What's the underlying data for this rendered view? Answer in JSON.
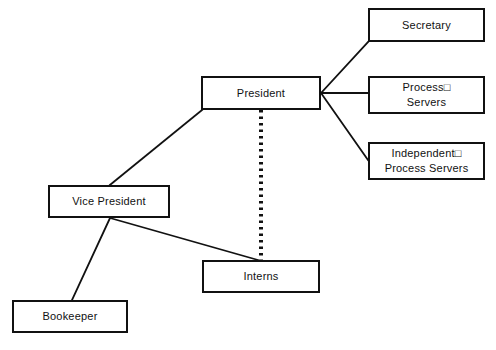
{
  "diagram": {
    "type": "org-chart",
    "canvas": {
      "width": 496,
      "height": 350,
      "background": "#ffffff"
    },
    "line_color": "#111111",
    "box_border_color": "#111111",
    "box_fill_color": "#ffffff",
    "text_color": "#111111",
    "nodes": [
      {
        "id": "president",
        "label": "President",
        "x": 201,
        "y": 76,
        "width": 120,
        "height": 34
      },
      {
        "id": "secretary",
        "label": "Secretary",
        "x": 368,
        "y": 8,
        "width": 117,
        "height": 34
      },
      {
        "id": "process-servers",
        "label": "Process□\nServers",
        "x": 368,
        "y": 76,
        "width": 117,
        "height": 38
      },
      {
        "id": "independent-process-servers",
        "label": "Independent□\nProcess Servers",
        "x": 368,
        "y": 142,
        "width": 117,
        "height": 38
      },
      {
        "id": "vice-president",
        "label": "Vice President",
        "x": 48,
        "y": 185,
        "width": 122,
        "height": 33
      },
      {
        "id": "interns",
        "label": "Interns",
        "x": 202,
        "y": 260,
        "width": 118,
        "height": 33
      },
      {
        "id": "bookeeper",
        "label": "Bookeeper",
        "x": 12,
        "y": 300,
        "width": 116,
        "height": 33
      }
    ],
    "edges": [
      {
        "id": "president-secretary",
        "from": "president",
        "to": "secretary",
        "style": "solid",
        "x1": 321,
        "y1": 93,
        "x2": 368,
        "y2": 42
      },
      {
        "id": "president-process-servers",
        "from": "president",
        "to": "process-servers",
        "style": "solid",
        "x1": 321,
        "y1": 93,
        "x2": 368,
        "y2": 93
      },
      {
        "id": "president-independent-process-servers",
        "from": "president",
        "to": "independent-process-servers",
        "style": "solid",
        "x1": 321,
        "y1": 93,
        "x2": 368,
        "y2": 160
      },
      {
        "id": "president-vice-president",
        "from": "president",
        "to": "vice-president",
        "style": "solid",
        "x1": 202,
        "y1": 110,
        "x2": 110,
        "y2": 185
      },
      {
        "id": "vice-president-bookeeper",
        "from": "vice-president",
        "to": "bookeeper",
        "style": "solid",
        "x1": 110,
        "y1": 218,
        "x2": 72,
        "y2": 300
      },
      {
        "id": "vice-president-interns",
        "from": "vice-president",
        "to": "interns",
        "style": "solid",
        "x1": 110,
        "y1": 218,
        "x2": 258,
        "y2": 260
      },
      {
        "id": "president-interns-dotted",
        "from": "president",
        "to": "interns",
        "style": "dotted",
        "x1": 261,
        "y1": 110,
        "x2": 261,
        "y2": 260
      }
    ]
  }
}
